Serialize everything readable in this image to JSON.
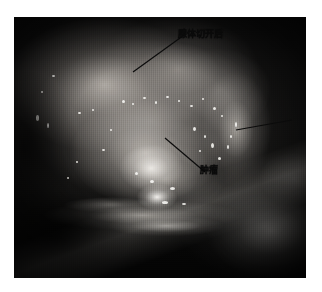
{
  "page": {
    "background_color": "#ffffff",
    "type": "intraoperative-photograph"
  },
  "photograph": {
    "modality": "endoscopic / intraoperative surgical field",
    "dominant_color": "#101010",
    "highlight_color": "#f0eee9",
    "midtone_color": "#8a8782"
  },
  "annotations": {
    "leader_line_color": "#0b0b0b",
    "items": [
      {
        "id": "tissue",
        "label": "腺体切开后",
        "target_description": "upper glandular tissue after incision",
        "line": {
          "x1": 119,
          "y1": 55,
          "x2": 166,
          "y2": 21
        }
      },
      {
        "id": "tumor",
        "label": "肿瘤",
        "target_description": "bright tumor nodule in central field",
        "line": {
          "x1": 151,
          "y1": 121,
          "x2": 191,
          "y2": 155
        }
      },
      {
        "id": "unlabeled-right",
        "label": "",
        "target_description": "retracted flap at right margin",
        "line": {
          "x1": 222,
          "y1": 113,
          "x2": 278,
          "y2": 103
        }
      }
    ]
  }
}
